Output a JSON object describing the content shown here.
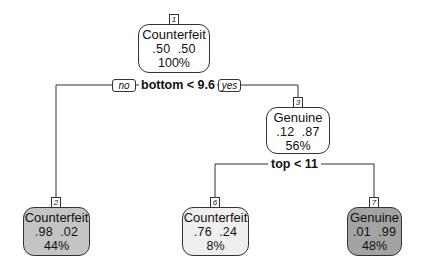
{
  "diagram": {
    "type": "decision-tree",
    "nodes": [
      {
        "id": "1",
        "class": "Counterfeit",
        "probs": ".50  .50",
        "percent": "100%",
        "fill": "#ffffff"
      },
      {
        "id": "2",
        "class": "Counterfeit",
        "probs": ".98  .02",
        "percent": "44%",
        "fill": "#c4c4c4"
      },
      {
        "id": "3",
        "class": "Genuine",
        "probs": ".12  .87",
        "percent": "56%",
        "fill": "#ffffff"
      },
      {
        "id": "6",
        "class": "Counterfeit",
        "probs": ".76  .24",
        "percent": "8%",
        "fill": "#efefef"
      },
      {
        "id": "7",
        "class": "Genuine",
        "probs": ".01  .99",
        "percent": "48%",
        "fill": "#a3a3a3"
      }
    ],
    "splits": [
      {
        "node": "1",
        "label": "bottom < 9.6",
        "left_tag": "no",
        "right_tag": "yes"
      },
      {
        "node": "3",
        "label": "top < 11"
      }
    ],
    "edges": [
      {
        "from": "1",
        "to": "2"
      },
      {
        "from": "1",
        "to": "3"
      },
      {
        "from": "3",
        "to": "6"
      },
      {
        "from": "3",
        "to": "7"
      }
    ]
  }
}
